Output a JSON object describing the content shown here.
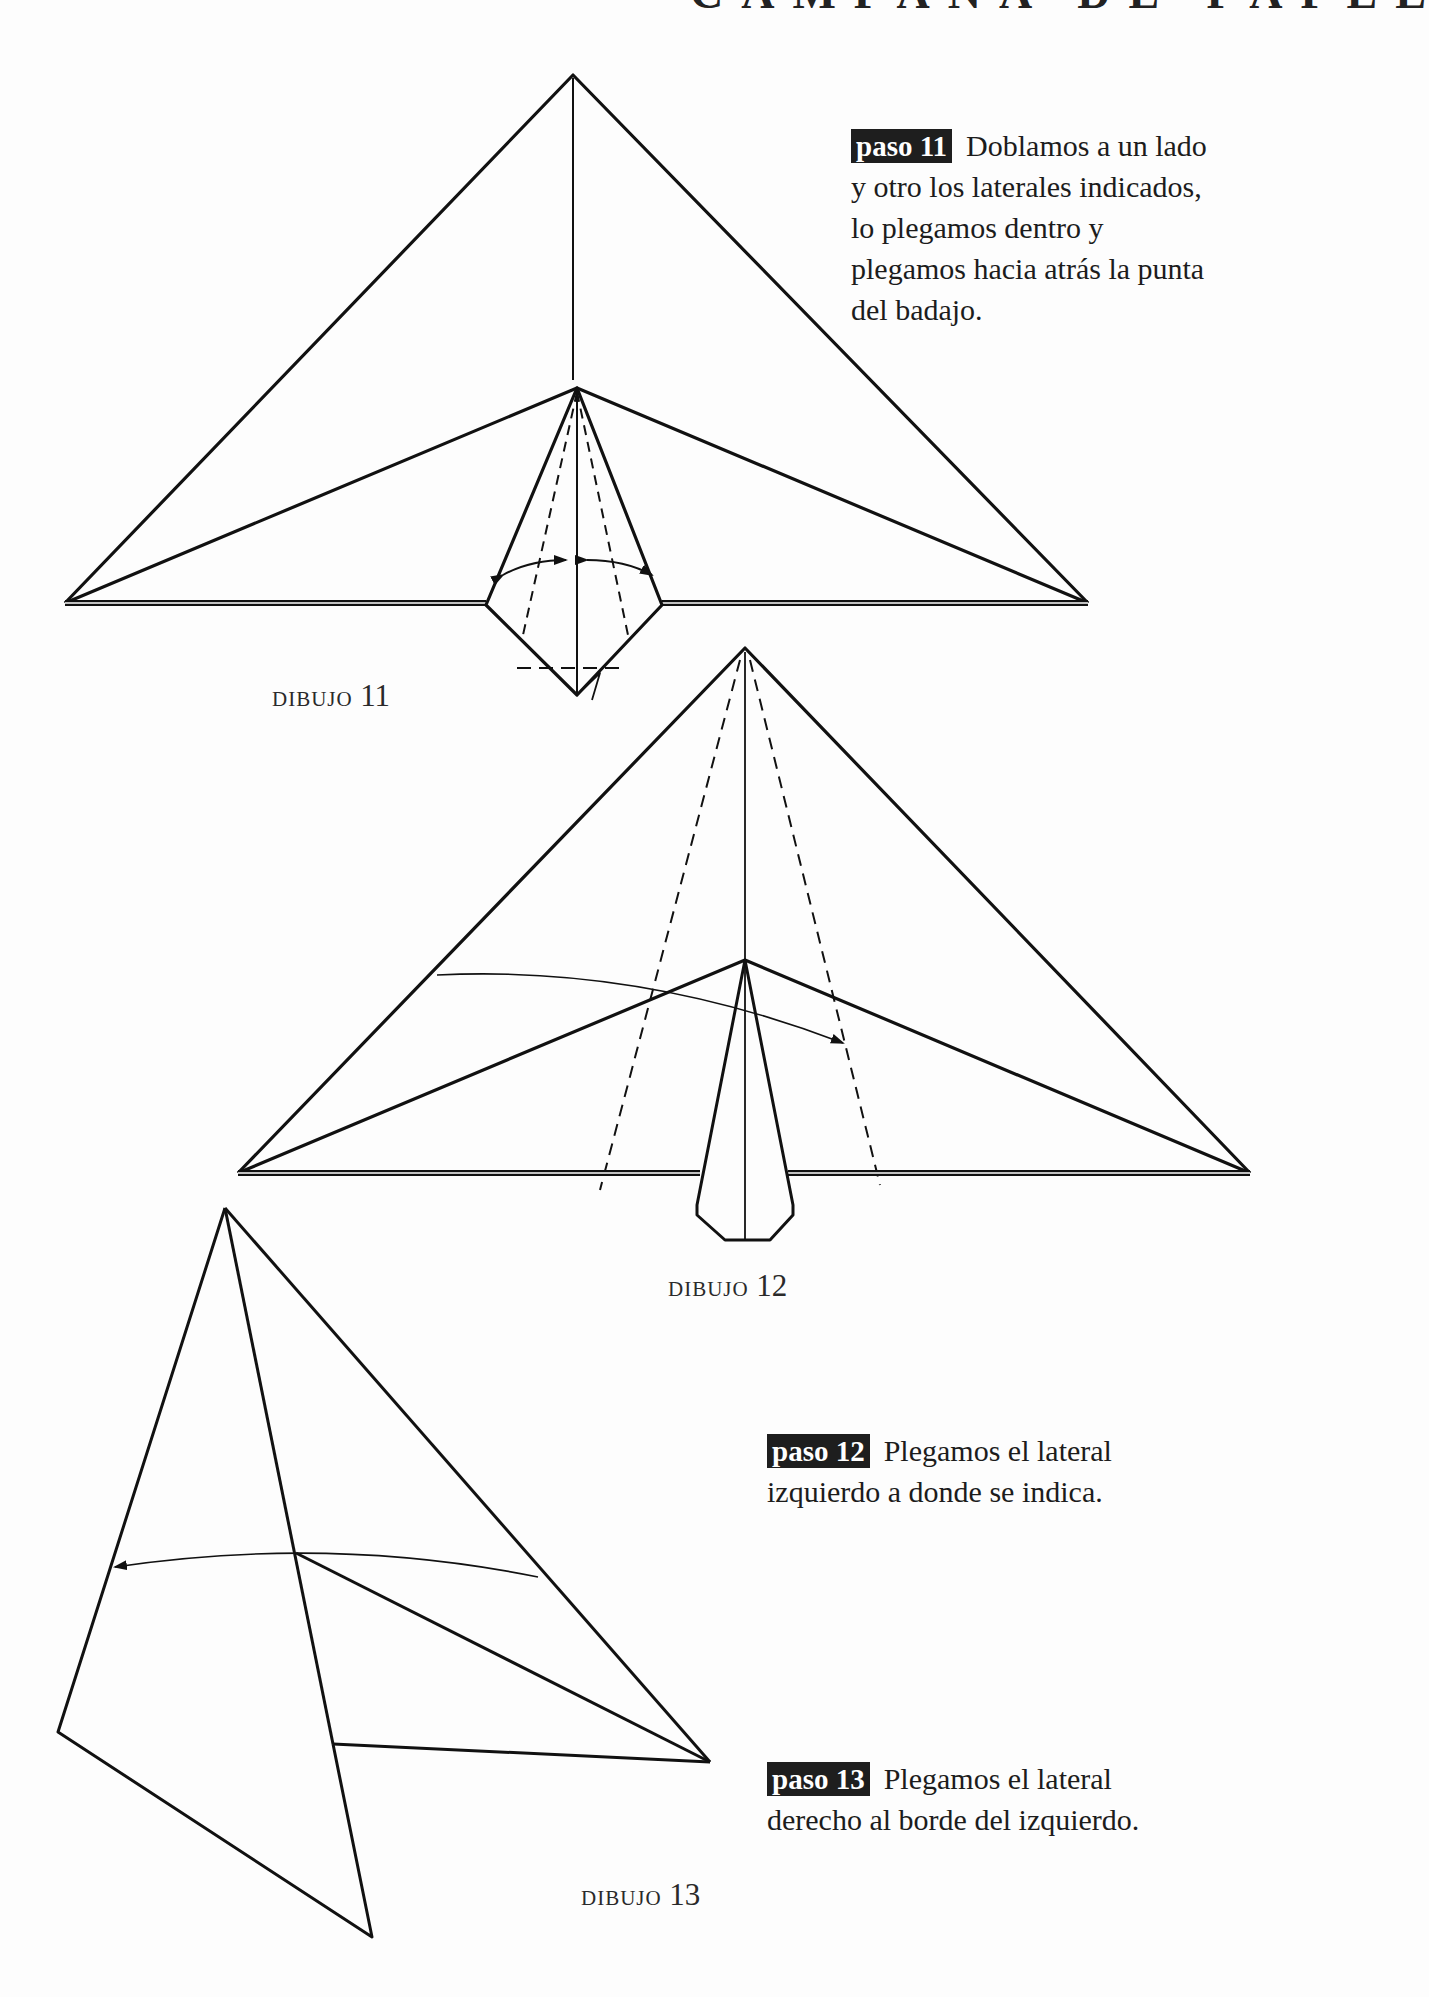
{
  "header": {
    "title_clipped": "CAMPANA DE PAPEL"
  },
  "steps": [
    {
      "badge": "paso 11",
      "text": "Doblamos a un lado y otro los laterales indicados, lo plegamos dentro y plegamos hacia atrás la punta del badajo."
    },
    {
      "badge": "paso 12",
      "text": "Plegamos el lateral izquierdo a donde se indica."
    },
    {
      "badge": "paso 13",
      "text": "Plegamos el lateral derecho al borde del izquierdo."
    }
  ],
  "captions": [
    {
      "word": "dibujo",
      "number": "11"
    },
    {
      "word": "dibujo",
      "number": "12"
    },
    {
      "word": "dibujo",
      "number": "13"
    }
  ],
  "colors": {
    "ink": "#111111",
    "paper": "#fdfdfd",
    "badge_bg": "#1e1e1e",
    "badge_text": "#ffffff"
  },
  "diagrams": {
    "dibujo_11": {
      "outer_triangle": "65,603 573,75 1088,603",
      "inner_fold": "65,603 577,388 1088,603",
      "center_line": "573,78 573,380",
      "flap": "577,388 486,605 577,695 662,605",
      "flap_center": "577,388 577,695",
      "dashed_left": "577,392 523,635",
      "dashed_right": "577,392 628,635",
      "dashed_horizontal": "517,668 625,668",
      "base_left": "65,603 486,603",
      "base_right": "662,603 1088,603",
      "arc_left": "M 503 575 Q 530 560 566 560",
      "arc_right": "M 587 560 Q 625 560 652 575",
      "fold_tip": "577,695 600,673 592,700"
    },
    "dibujo_12": {
      "outer_triangle": "238,1173 745,648 1250,1173",
      "inner_fold": "238,1173 745,960 1250,1173",
      "center_line": "745,652 745,1240",
      "flap": "745,960 697,1205 697,1215 725,1240 770,1240 793,1215 793,1205",
      "dashed_left": "740,660 600,1190",
      "dashed_right": "750,660 880,1185",
      "base_left": "238,1173 700,1173",
      "base_right": "788,1173 1250,1173",
      "arrow_curve": "M 437 975 Q 640 965 843 1043"
    },
    "dibujo_13": {
      "left_panel": "225,1208 58,1732 372,1937 333,1744",
      "right_edge": "225,1208 710,1762",
      "crease": "225,1208 333,1744",
      "inner_line": "296,1553 710,1762",
      "bottom_line": "333,1744 710,1762",
      "arrow_curve": "M 538 1577 Q 330 1535 115 1567"
    }
  }
}
